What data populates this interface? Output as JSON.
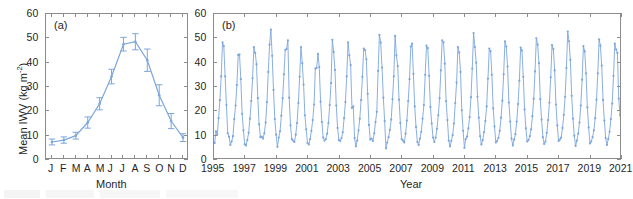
{
  "figure": {
    "axis_color": "#8c8c8c",
    "series_color": "#7CA6DC",
    "ylabel_main": "Mean IWV (kg m",
    "ylabel_exp": "-2",
    "ylabel_close": ")"
  },
  "panel_a": {
    "tag": "(a)",
    "xlabel": "Month",
    "ylabel": "Mean IWV (kg m-2)",
    "ytick_labels": [
      "0",
      "10",
      "20",
      "30",
      "40",
      "50",
      "60"
    ],
    "xtick_labels": [
      "J",
      "F",
      "M",
      "A",
      "M",
      "J",
      "J",
      "A",
      "S",
      "O",
      "N",
      "D"
    ]
  },
  "panel_b": {
    "tag": "(b)",
    "xlabel": "Year",
    "ytick_labels": [
      "0",
      "10",
      "20",
      "30",
      "40",
      "50",
      "60"
    ],
    "xtick_labels": [
      "1995",
      "1997",
      "1999",
      "2001",
      "2003",
      "2005",
      "2007",
      "2009",
      "2011",
      "2013",
      "2015",
      "2017",
      "2019",
      "2021"
    ]
  },
  "chart_data": [
    {
      "type": "line",
      "panel": "(a)",
      "title": "",
      "xlabel": "Month",
      "ylabel": "Mean IWV (kg m^-2)",
      "ylim": [
        0,
        60
      ],
      "yticks": [
        0,
        10,
        20,
        30,
        40,
        50,
        60
      ],
      "grid": false,
      "errorbars": true,
      "categories": [
        "J",
        "F",
        "M",
        "A",
        "M",
        "J",
        "J",
        "A",
        "S",
        "O",
        "N",
        "D"
      ],
      "values": [
        7.4,
        8.2,
        10.0,
        15.4,
        23.1,
        34.3,
        47.6,
        48.6,
        41.0,
        26.6,
        16.0,
        9.2
      ],
      "err_low": [
        6.2,
        6.9,
        8.6,
        13.1,
        20.6,
        31.3,
        44.8,
        45.3,
        36.4,
        22.3,
        12.9,
        7.6
      ],
      "err_high": [
        8.6,
        9.5,
        11.4,
        17.7,
        25.6,
        37.3,
        50.4,
        51.9,
        45.6,
        30.9,
        19.1,
        10.8
      ]
    },
    {
      "type": "line",
      "panel": "(b)",
      "title": "",
      "xlabel": "Year",
      "ylabel": "Mean IWV (kg m^-2)",
      "ylim": [
        0,
        60
      ],
      "yticks": [
        0,
        10,
        20,
        30,
        40,
        50,
        60
      ],
      "xlim": [
        1995,
        2021.0
      ],
      "xticks": [
        1995,
        1997,
        1999,
        2001,
        2003,
        2005,
        2007,
        2009,
        2011,
        2013,
        2015,
        2017,
        2019,
        2021
      ],
      "grid": false,
      "x_start_year": 1995,
      "x_step_months": 1,
      "note": "Monthly mean IWV time series, Jan 1995 through Dec 2020",
      "values": [
        7.0,
        11.8,
        10.4,
        17.2,
        24.6,
        34.4,
        48.4,
        46.8,
        34.4,
        22.6,
        11.0,
        9.6,
        6.2,
        7.6,
        9.8,
        16.8,
        22.4,
        30.8,
        43.2,
        43.4,
        33.2,
        19.0,
        12.2,
        6.4,
        6.0,
        8.2,
        11.2,
        17.0,
        24.2,
        33.6,
        46.4,
        44.0,
        39.4,
        25.4,
        14.6,
        9.4,
        9.6,
        8.8,
        11.0,
        15.4,
        23.8,
        36.2,
        47.4,
        53.6,
        42.8,
        28.8,
        16.8,
        10.4,
        5.4,
        9.2,
        11.8,
        18.2,
        25.4,
        35.2,
        45.2,
        45.6,
        49.2,
        25.6,
        14.2,
        8.6,
        8.0,
        7.4,
        10.4,
        15.2,
        23.4,
        34.2,
        46.4,
        39.8,
        31.0,
        18.4,
        12.6,
        7.0,
        6.4,
        8.6,
        12.0,
        16.4,
        22.8,
        37.6,
        37.8,
        43.6,
        38.2,
        24.0,
        15.6,
        9.2,
        8.0,
        8.6,
        10.8,
        15.2,
        22.6,
        31.6,
        49.4,
        44.4,
        37.0,
        22.4,
        13.2,
        8.2,
        7.8,
        9.0,
        11.4,
        17.2,
        23.8,
        34.4,
        48.4,
        43.0,
        39.0,
        21.4,
        22.0,
        9.0,
        5.6,
        8.0,
        12.2,
        17.0,
        24.6,
        34.2,
        45.8,
        45.2,
        41.4,
        27.2,
        14.4,
        8.4,
        8.8,
        7.8,
        11.0,
        15.6,
        19.8,
        36.6,
        51.4,
        48.2,
        38.0,
        25.6,
        16.0,
        4.8,
        7.2,
        9.4,
        12.4,
        16.6,
        25.0,
        34.4,
        51.0,
        43.0,
        38.6,
        24.8,
        15.2,
        8.6,
        8.0,
        7.2,
        10.8,
        16.2,
        24.2,
        33.2,
        46.6,
        47.8,
        35.4,
        22.0,
        13.6,
        7.4,
        6.2,
        8.8,
        11.6,
        17.0,
        22.6,
        35.0,
        47.0,
        46.0,
        34.6,
        21.8,
        15.0,
        9.2,
        7.4,
        9.2,
        12.8,
        18.4,
        25.4,
        36.8,
        49.2,
        48.4,
        39.6,
        24.2,
        16.4,
        8.0,
        5.6,
        7.8,
        10.2,
        15.0,
        23.4,
        31.8,
        46.4,
        44.2,
        36.2,
        20.4,
        12.0,
        5.0,
        8.6,
        9.6,
        13.0,
        17.6,
        25.8,
        37.6,
        52.2,
        46.4,
        40.0,
        26.0,
        17.4,
        9.8,
        6.4,
        8.2,
        11.4,
        16.0,
        22.0,
        33.4,
        45.8,
        44.8,
        35.0,
        21.2,
        13.8,
        7.2,
        7.8,
        9.0,
        12.0,
        17.4,
        24.4,
        35.2,
        48.8,
        46.6,
        38.4,
        23.6,
        15.8,
        8.8,
        6.0,
        8.4,
        10.6,
        15.8,
        23.0,
        32.6,
        46.2,
        45.0,
        34.2,
        20.8,
        13.0,
        7.6,
        8.2,
        9.8,
        12.6,
        18.0,
        25.2,
        36.4,
        50.0,
        47.4,
        39.8,
        25.0,
        16.6,
        9.4,
        6.6,
        7.6,
        11.2,
        16.4,
        23.6,
        34.0,
        47.2,
        45.6,
        36.8,
        22.8,
        14.2,
        7.8,
        8.4,
        9.2,
        13.2,
        18.6,
        26.0,
        37.8,
        52.8,
        48.8,
        41.2,
        26.4,
        17.0,
        10.0,
        5.8,
        8.0,
        10.8,
        15.4,
        22.4,
        33.0,
        46.8,
        44.6,
        35.6,
        21.6,
        13.4,
        6.8,
        7.6,
        9.4,
        12.2,
        17.2,
        24.8,
        35.6,
        49.6,
        47.0,
        38.8,
        24.6,
        16.2,
        9.0,
        6.2,
        8.6,
        11.6,
        16.8,
        23.2,
        34.6,
        47.8,
        45.4,
        44.0,
        25.2,
        18.6,
        11.8
      ]
    }
  ]
}
